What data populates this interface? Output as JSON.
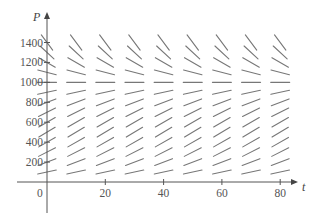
{
  "figure": {
    "type": "direction-field",
    "equation_hint": "logistic: dP/dt = kP(1 - P/1000)",
    "colors": {
      "axis": "#555555",
      "segments": "#777777",
      "text": "#555555"
    }
  },
  "axes": {
    "x": {
      "label": "t",
      "ticks": [
        0,
        20,
        40,
        60,
        80
      ],
      "tick_labels": [
        "0",
        "20",
        "40",
        "60",
        "80"
      ],
      "range": [
        -10,
        85
      ]
    },
    "y": {
      "label": "P",
      "ticks": [
        200,
        400,
        600,
        800,
        1000,
        1200,
        1400
      ],
      "tick_labels": [
        "200",
        "400",
        "600",
        "800",
        "1000",
        "1200",
        "1400"
      ],
      "range": [
        -100,
        1500
      ]
    },
    "origin_label": "0"
  },
  "field": {
    "t_values": [
      0,
      10,
      20,
      30,
      40,
      50,
      60,
      70,
      80
    ],
    "P_values": [
      100,
      200,
      300,
      400,
      500,
      600,
      700,
      800,
      900,
      1000,
      1100,
      1200,
      1300,
      1400
    ],
    "k": 0.07,
    "carrying_capacity": 1000,
    "segment_length_px": 19
  }
}
